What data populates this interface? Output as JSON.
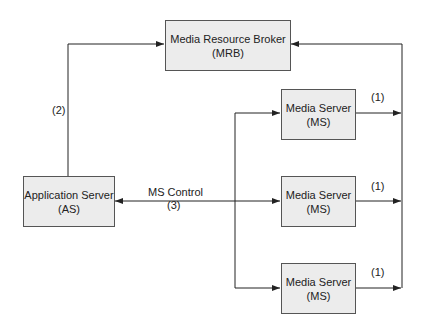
{
  "nodes": {
    "mrb": {
      "line1": "Media Resource Broker",
      "line2": "(MRB)"
    },
    "as": {
      "line1": "Application Server",
      "line2": "(AS)"
    },
    "ms": [
      {
        "line1": "Media Server",
        "line2": "(MS)"
      },
      {
        "line1": "Media Server",
        "line2": "(MS)"
      },
      {
        "line1": "Media Server",
        "line2": "(MS)"
      }
    ]
  },
  "edges": {
    "as_to_mrb": "(2)",
    "ms_control": "MS Control",
    "ms_control_num": "(3)",
    "ms_to_mrb": [
      "(1)",
      "(1)",
      "(1)"
    ]
  },
  "colors": {
    "box_fill": "#ececec",
    "line": "#222222"
  }
}
